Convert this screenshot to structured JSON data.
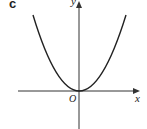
{
  "figure": {
    "part_label": "c",
    "x_axis_label": "x",
    "y_axis_label": "y",
    "origin_label": "O",
    "curve": "parabola opening upward with vertex at origin",
    "colors": {
      "curve": "#222222",
      "axes": "#333333"
    }
  }
}
